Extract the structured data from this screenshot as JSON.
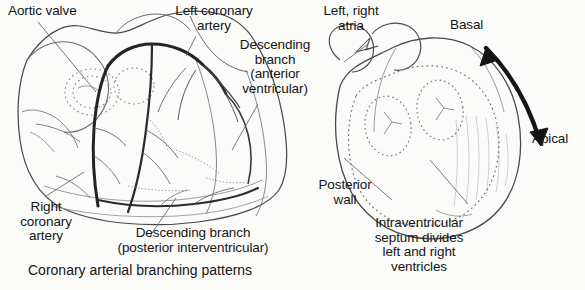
{
  "figure": {
    "title": "Coronary arterial branching patterns",
    "background_color": "#fbfbfa",
    "ink_color": "#1a1a1a",
    "artery_color": "#2a2a2a"
  },
  "left_panel": {
    "name": "anterior heart with coronary arteries",
    "labels": {
      "aortic_valve": "Aortic valve",
      "left_coronary_artery": "Left coronary\nartery",
      "descending_anterior": "Descending\nbranch\n(anterior\nventricular)",
      "right_coronary_artery": "Right\ncoronary\nartery",
      "descending_posterior": "Descending branch\n(posterior interventricular)"
    },
    "caption": "Coronary arterial branching patterns"
  },
  "right_panel": {
    "name": "heart short axis orientation",
    "labels": {
      "atria": "Left, right\natria",
      "basal": "Basal",
      "apical": "Apical",
      "posterior_wall": "Posterior\nwall",
      "septum": "Intraventricular\nseptum divides\nleft and right\nventricles"
    }
  }
}
